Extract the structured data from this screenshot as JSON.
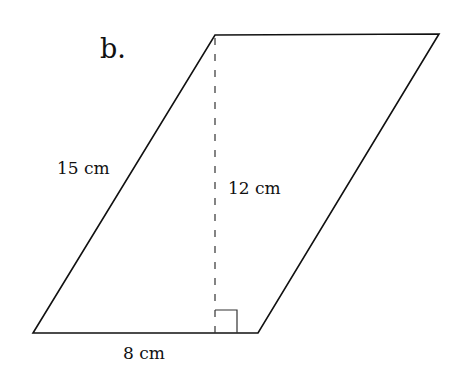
{
  "diagram": {
    "part_label": "b.",
    "shape": "parallelogram",
    "labels": {
      "slant_side": "15 cm",
      "height": "12 cm",
      "base": "8 cm"
    },
    "right_angle_marker": true,
    "colors": {
      "line": "#111111",
      "background": "#ffffff"
    }
  }
}
